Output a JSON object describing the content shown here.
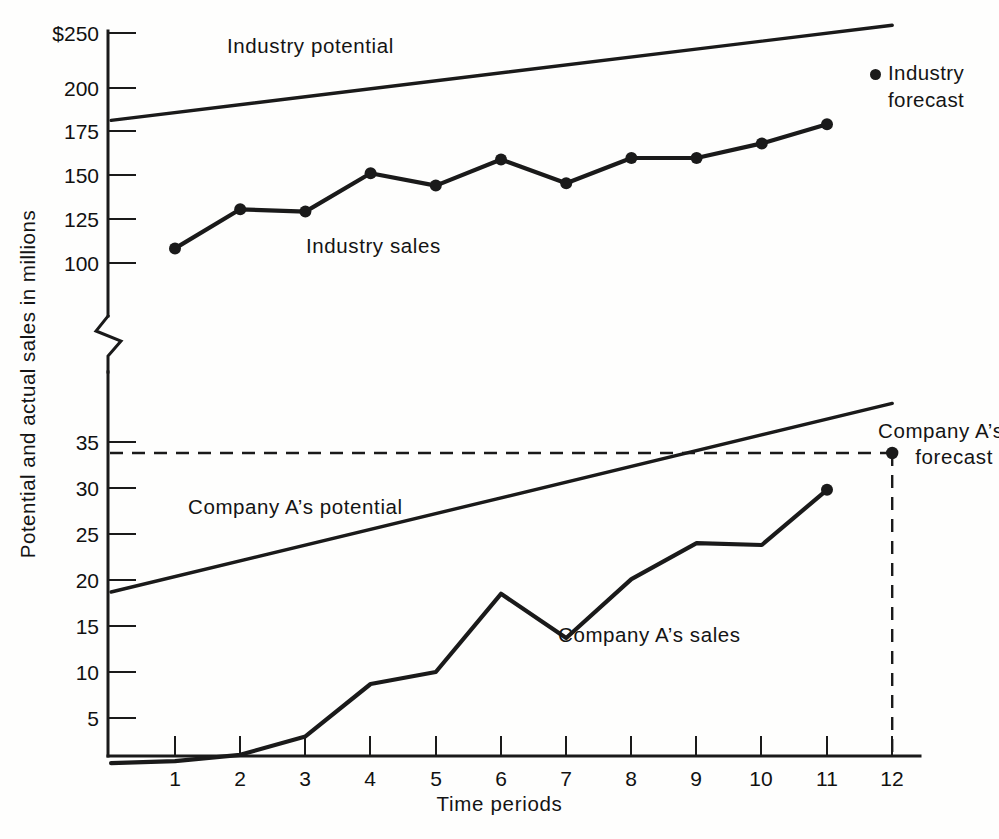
{
  "chart_data": {
    "type": "line",
    "title": "",
    "xlabel": "Time periods",
    "ylabel": "Potential and actual sales in millions",
    "x": [
      1,
      2,
      3,
      4,
      5,
      6,
      7,
      8,
      9,
      10,
      11,
      12
    ],
    "xtick_labels": [
      "1",
      "2",
      "3",
      "4",
      "5",
      "6",
      "7",
      "8",
      "9",
      "10",
      "11",
      "12"
    ],
    "axis_break": true,
    "upper_axis": {
      "ytick_labels": [
        "$250",
        "200",
        "175",
        "150",
        "125",
        "100"
      ],
      "ytick_values": [
        250,
        200,
        175,
        150,
        125,
        100
      ],
      "ylim": [
        95,
        258
      ]
    },
    "lower_axis": {
      "ytick_labels": [
        "35",
        "30",
        "25",
        "20",
        "15",
        "10",
        "5"
      ],
      "ytick_values": [
        35,
        30,
        25,
        20,
        15,
        10,
        5
      ],
      "ylim": [
        0,
        41
      ]
    },
    "series": [
      {
        "name": "Industry potential",
        "style": "solid-trend",
        "panel": "upper",
        "x": [
          0.02,
          12
        ],
        "values": [
          193,
          255
        ],
        "markers": false
      },
      {
        "name": "Industry sales",
        "style": "solid-markers",
        "panel": "upper",
        "x": [
          1,
          2,
          3,
          4,
          5,
          6,
          7,
          8,
          9,
          10,
          11
        ],
        "values": [
          109.5,
          135,
          133.5,
          158.5,
          150.5,
          167.5,
          152,
          168.5,
          168.5,
          178,
          190.5
        ],
        "markers": true
      },
      {
        "name": "Company A's potential",
        "style": "solid-trend",
        "panel": "lower",
        "x": [
          0.02,
          12
        ],
        "values": [
          18.7,
          39.2
        ],
        "markers": false
      },
      {
        "name": "Company A's sales",
        "style": "solid-markers",
        "panel": "lower",
        "x": [
          0.02,
          1,
          2,
          3,
          4,
          5,
          6,
          7,
          8,
          9,
          10,
          11
        ],
        "values": [
          0.1,
          0.3,
          1.0,
          3.0,
          8.7,
          10.0,
          18.5,
          13.7,
          20.1,
          24.0,
          23.8,
          29.8
        ],
        "markers": false,
        "end_marker": true
      },
      {
        "name": "Company A's forecast",
        "style": "dashed-marker",
        "panel": "lower",
        "x": [
          12
        ],
        "values": [
          33.8
        ],
        "markers": true
      }
    ],
    "annotations": [
      {
        "name": "industry-potential-label",
        "text": "Industry potential",
        "x_px": 227,
        "y_px": 33
      },
      {
        "name": "industry-sales-label",
        "text": "Industry sales",
        "x_px": 306,
        "y_px": 233
      },
      {
        "name": "company-potential-label",
        "text": "Company A’s potential",
        "x_px": 188,
        "y_px": 494
      },
      {
        "name": "company-sales-label",
        "text": "Company A’s sales",
        "x_px": 558,
        "y_px": 622
      }
    ],
    "legend": {
      "position": "upper-right",
      "entries": [
        {
          "label_line1": "Industry",
          "label_line2": "forecast",
          "marker": "filled-circle"
        }
      ]
    },
    "company_forecast_callout": {
      "line1": "Company A’s",
      "line2": "forecast"
    },
    "grid": false,
    "colors": {
      "ink": "#1a1a1a",
      "background": "#fefefd"
    }
  }
}
